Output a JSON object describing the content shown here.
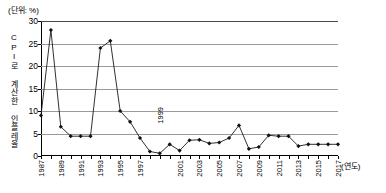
{
  "unit_note": "(단위: %)",
  "y_axis_title": "CPI로 계산한 인플레율",
  "x_axis_title": "(연도)",
  "inline_annotation": "1999",
  "colors": {
    "line": "#1a1a1a",
    "marker": "#111111",
    "gridline": "#9a9a9a",
    "axis": "#000000",
    "background": "#ffffff"
  },
  "chart_data": {
    "type": "line",
    "title": "",
    "subtitle": "",
    "xlabel": "(연도)",
    "ylabel": "CPI로 계산한 인플레율",
    "unit": "%",
    "grid": true,
    "legend": false,
    "xlim": [
      1987,
      2017
    ],
    "ylim": [
      0,
      30
    ],
    "yticks": [
      0,
      5,
      10,
      15,
      20,
      25,
      30
    ],
    "xticks": [
      1987,
      1989,
      1991,
      1993,
      1995,
      1997,
      1999,
      2001,
      2003,
      2005,
      2007,
      2009,
      2011,
      2013,
      2015,
      2017
    ],
    "xtick_labels": [
      "1987",
      "1989",
      "1991",
      "1993",
      "1995",
      "1997",
      "1999",
      "2001",
      "2003",
      "2005",
      "2007",
      "2009",
      "2011",
      "2013",
      "2015",
      "2017"
    ],
    "marker": "diamond",
    "x": [
      1987,
      1988,
      1989,
      1990,
      1991,
      1992,
      1993,
      1994,
      1995,
      1996,
      1997,
      1998,
      1999,
      2000,
      2001,
      2002,
      2003,
      2004,
      2005,
      2006,
      2007,
      2008,
      2009,
      2010,
      2011,
      2012,
      2013,
      2014,
      2015,
      2016,
      2017
    ],
    "values": [
      9.0,
      28.0,
      6.5,
      4.4,
      4.4,
      4.4,
      24.0,
      25.6,
      10.0,
      7.6,
      4.0,
      1.0,
      0.6,
      2.6,
      1.2,
      3.5,
      3.6,
      2.8,
      3.0,
      4.0,
      6.8,
      1.6,
      2.0,
      4.6,
      4.4,
      4.4,
      2.2,
      2.6,
      2.6,
      2.6,
      2.6
    ],
    "series": [
      {
        "name": "CPI로 계산한 인플레율",
        "values": [
          9.0,
          28.0,
          6.5,
          4.4,
          4.4,
          4.4,
          24.0,
          25.6,
          10.0,
          7.6,
          4.0,
          1.0,
          0.6,
          2.6,
          1.2,
          3.5,
          3.6,
          2.8,
          3.0,
          4.0,
          6.8,
          1.6,
          2.0,
          4.6,
          4.4,
          4.4,
          2.2,
          2.6,
          2.6,
          2.6,
          2.6
        ]
      }
    ]
  }
}
